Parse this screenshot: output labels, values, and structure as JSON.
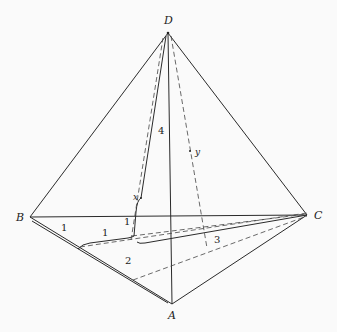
{
  "diagram": {
    "type": "tetrahedron-geodesic-path",
    "vertices": [
      {
        "name": "D",
        "x": 168,
        "y": 33,
        "label": "D"
      },
      {
        "name": "B",
        "x": 30,
        "y": 217,
        "label": "B"
      },
      {
        "name": "C",
        "x": 307,
        "y": 215,
        "label": "C"
      },
      {
        "name": "A",
        "x": 172,
        "y": 304,
        "label": "A"
      }
    ],
    "edge_labels": [
      {
        "text": "1",
        "note": "segment along BA near B"
      },
      {
        "text": "1",
        "note": "segment on base fold"
      },
      {
        "text": "1",
        "note": "short segment near x"
      },
      {
        "text": "2",
        "note": "segment along BA"
      },
      {
        "text": "3",
        "note": "dashed segment near C"
      },
      {
        "text": "4",
        "note": "dashed segment toward D"
      }
    ],
    "variables": [
      {
        "text": "x",
        "note": "point on path toward D"
      },
      {
        "text": "y",
        "note": "point on DC-side dashed line"
      }
    ],
    "colors": {
      "line": "#2a2a2a",
      "background": "#fafafa"
    }
  },
  "labels": {
    "D": "D",
    "B": "B",
    "C": "C",
    "A": "A",
    "one_a": "1",
    "one_b": "1",
    "one_c": "1",
    "two": "2",
    "three": "3",
    "four": "4",
    "x": "x",
    "y": "y"
  }
}
